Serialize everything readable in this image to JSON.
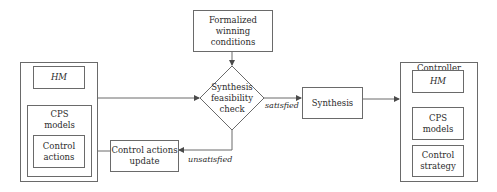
{
  "diagram": {
    "type": "flowchart",
    "nodes": {
      "winning_conditions": {
        "line1": "Formalized winning",
        "line2": "conditions"
      },
      "feasibility_check": {
        "line1": "Synthesis",
        "line2": "feasibility",
        "line3": "check"
      },
      "synthesis": {
        "label": "Synthesis"
      },
      "control_update": {
        "line1": "Control actions",
        "line2": "update"
      },
      "input_group": {
        "hm": "HM",
        "cps": {
          "line1": "CPS",
          "line2": "models"
        },
        "control_actions": {
          "line1": "Control",
          "line2": "actions"
        }
      },
      "controller": {
        "title": "Controller",
        "hm": "HM",
        "cps": {
          "line1": "CPS",
          "line2": "models"
        },
        "strategy": {
          "line1": "Control",
          "line2": "strategy"
        }
      }
    },
    "edges": {
      "satisfied": "satisfied",
      "unsatisfied": "unsatisfied"
    },
    "colors": {
      "line": "#6a6a6a",
      "text": "#2b2b2b",
      "background": "#ffffff"
    }
  }
}
